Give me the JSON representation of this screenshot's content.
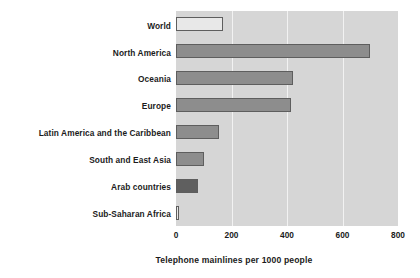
{
  "chart_data": {
    "type": "bar",
    "orientation": "horizontal",
    "title": "",
    "xlabel": "Telephone mainlines per 1000 people",
    "ylabel": "",
    "xlim": [
      0,
      800
    ],
    "xticks": [
      0,
      200,
      400,
      600,
      800
    ],
    "xtick_labels": [
      "0",
      "200",
      "400",
      "600",
      "800"
    ],
    "grid": true,
    "grid_axis": "x",
    "legend": false,
    "plot_background": "#d6d6d6",
    "gridline_color": "#f2f2f2",
    "categories": [
      "World",
      "North America",
      "Oceania",
      "Europe",
      "Latin America and the Caribbean",
      "South and East Asia",
      "Arab countries",
      "Sub-Saharan Africa"
    ],
    "values": [
      170,
      700,
      420,
      415,
      155,
      100,
      80,
      12
    ],
    "bar_styles": [
      "fill-light",
      "fill-mid",
      "fill-mid",
      "fill-mid",
      "fill-mid",
      "fill-mid",
      "fill-dark",
      "fill-light"
    ],
    "bar_colors": {
      "fill-light": "#e8e8e8",
      "fill-mid": "#8d8d8d",
      "fill-dark": "#5f5f5f",
      "outline": "#5e5e5e"
    }
  }
}
